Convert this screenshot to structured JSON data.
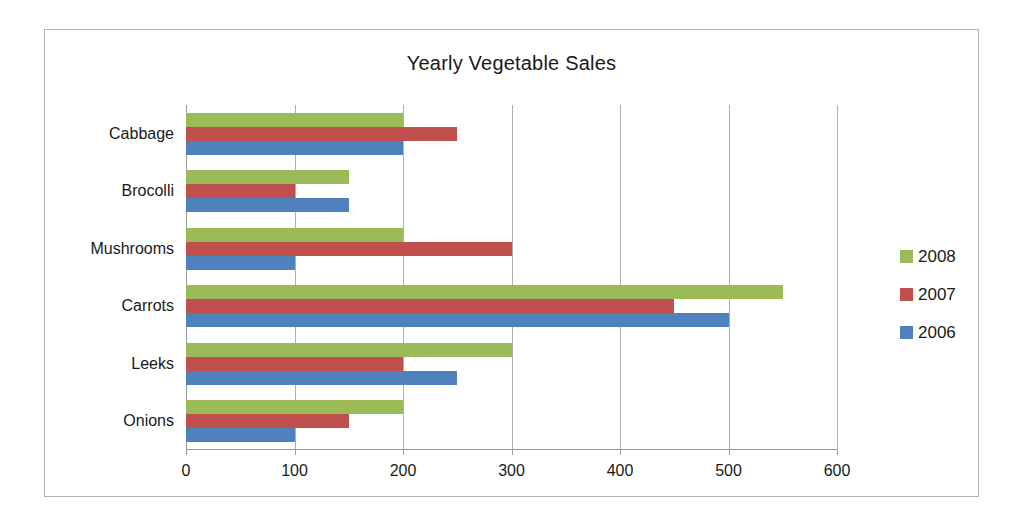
{
  "chart_data": {
    "type": "bar",
    "orientation": "horizontal",
    "title": "Yearly Vegetable Sales",
    "xlabel": "",
    "ylabel": "",
    "xlim": [
      0,
      600
    ],
    "xticks": [
      0,
      100,
      200,
      300,
      400,
      500,
      600
    ],
    "xtick_labels": [
      "0",
      "100",
      "200",
      "300",
      "400",
      "500",
      "600"
    ],
    "grid": true,
    "grid_axis": "x",
    "legend_position": "right",
    "categories": [
      "Cabbage",
      "Brocolli",
      "Mushrooms",
      "Carrots",
      "Leeks",
      "Onions"
    ],
    "series": [
      {
        "name": "2008",
        "color": "#9bbb59",
        "values": [
          200,
          150,
          200,
          550,
          300,
          200
        ]
      },
      {
        "name": "2007",
        "color": "#c0504d",
        "values": [
          250,
          100,
          300,
          450,
          200,
          150
        ]
      },
      {
        "name": "2006",
        "color": "#4f81bd",
        "values": [
          200,
          150,
          100,
          500,
          250,
          100
        ]
      }
    ]
  },
  "style": {
    "plot_border": "#b0b0b0",
    "frame_border": "#b3b3b3",
    "text": "#1a1a1a",
    "background": "#ffffff"
  }
}
